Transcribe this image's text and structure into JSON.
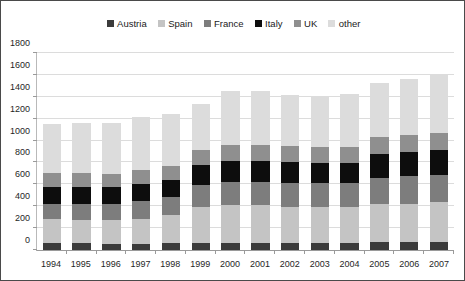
{
  "chart_data": {
    "type": "bar",
    "subtype": "stacked-column",
    "title": "",
    "xlabel": "",
    "ylabel": "",
    "ylim": [
      0,
      1800
    ],
    "ytick_step": 200,
    "yticks": [
      0,
      200,
      400,
      600,
      800,
      1000,
      1200,
      1400,
      1600,
      1800
    ],
    "grid": true,
    "legend_position": "top-center",
    "categories": [
      "1994",
      "1995",
      "1996",
      "1997",
      "1998",
      "1999",
      "2000",
      "2001",
      "2002",
      "2003",
      "2004",
      "2005",
      "2006",
      "2007"
    ],
    "series": [
      {
        "name": "Austria",
        "color": "#3b3b3b",
        "values": [
          60,
          60,
          55,
          55,
          60,
          65,
          65,
          65,
          60,
          60,
          60,
          70,
          70,
          75
        ]
      },
      {
        "name": "Spain",
        "color": "#c4c4c4",
        "values": [
          220,
          215,
          215,
          230,
          255,
          330,
          340,
          340,
          335,
          330,
          330,
          345,
          350,
          360
        ]
      },
      {
        "name": "France",
        "color": "#7d7d7d",
        "values": [
          140,
          145,
          150,
          160,
          165,
          200,
          215,
          215,
          215,
          215,
          215,
          240,
          250,
          250
        ]
      },
      {
        "name": "Italy",
        "color": "#0d0d0d",
        "values": [
          150,
          150,
          150,
          155,
          160,
          175,
          190,
          190,
          190,
          190,
          190,
          215,
          220,
          225
        ]
      },
      {
        "name": "UK",
        "color": "#8f8f8f",
        "values": [
          130,
          130,
          125,
          125,
          125,
          140,
          145,
          145,
          145,
          140,
          140,
          155,
          155,
          155
        ]
      },
      {
        "name": "other",
        "color": "#dcdcdc",
        "values": [
          450,
          455,
          460,
          485,
          475,
          420,
          495,
          495,
          465,
          470,
          480,
          495,
          510,
          530
        ]
      }
    ],
    "totals": [
      1150,
      1155,
      1155,
      1210,
      1240,
      1330,
      1450,
      1450,
      1410,
      1405,
      1415,
      1520,
      1555,
      1595
    ]
  },
  "legend": {
    "items": [
      {
        "label": "Austria",
        "color": "#3b3b3b"
      },
      {
        "label": "Spain",
        "color": "#c4c4c4"
      },
      {
        "label": "France",
        "color": "#7d7d7d"
      },
      {
        "label": "Italy",
        "color": "#0d0d0d"
      },
      {
        "label": "UK",
        "color": "#8f8f8f"
      },
      {
        "label": "other",
        "color": "#dcdcdc"
      }
    ]
  },
  "colors": {
    "frame_border": "#4a4a4a",
    "gridline": "#dcdcdc",
    "axis_line": "#9a9a9a",
    "background": "#ffffff",
    "text": "#1f1f1f"
  }
}
